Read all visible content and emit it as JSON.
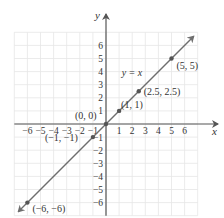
{
  "chart_data": {
    "type": "line",
    "title": "",
    "equation_label": "y = x",
    "xlabel": "x",
    "ylabel": "y",
    "xlim": [
      -7,
      7
    ],
    "ylim": [
      -7,
      7
    ],
    "grid": true,
    "x_ticks": [
      -6,
      -5,
      -4,
      -3,
      -2,
      -1,
      1,
      2,
      3,
      4,
      5,
      6
    ],
    "y_ticks": [
      -6,
      -5,
      -4,
      -3,
      -2,
      -1,
      1,
      2,
      3,
      4,
      5,
      6
    ],
    "series": [
      {
        "name": "y = x",
        "x": [
          -6.7,
          6.7
        ],
        "y": [
          -6.7,
          6.7
        ],
        "arrows": "both"
      }
    ],
    "points": [
      {
        "x": -6,
        "y": -6,
        "label": "(−6, −6)"
      },
      {
        "x": -1,
        "y": -1,
        "label": "(−1, −1)"
      },
      {
        "x": 0,
        "y": 0,
        "label": "(0, 0)"
      },
      {
        "x": 1,
        "y": 1,
        "label": "(1, 1)"
      },
      {
        "x": 2.5,
        "y": 2.5,
        "label": "(2.5, 2.5)"
      },
      {
        "x": 5,
        "y": 5,
        "label": "(5, 5)"
      }
    ]
  },
  "colors": {
    "grid": "#e6e6e6",
    "axis": "#555555",
    "line": "#6e6e6e",
    "point": "#555555",
    "text": "#333333"
  }
}
